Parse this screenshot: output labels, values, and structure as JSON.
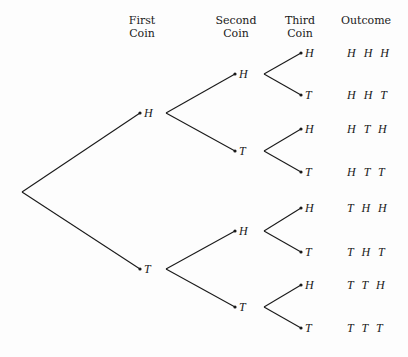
{
  "headers": {
    "first": [
      "First",
      "Coin"
    ],
    "second": [
      "Second",
      "Coin"
    ],
    "third": [
      "Third",
      "Coin"
    ],
    "outcome": "Outcome"
  },
  "tree": {
    "root": {
      "x": 22,
      "y": 192
    },
    "first": [
      {
        "label": "H",
        "x": 140,
        "y": 113,
        "fork_x": 166
      },
      {
        "label": "T",
        "x": 140,
        "y": 269,
        "fork_x": 166
      }
    ],
    "second": [
      {
        "label": "H",
        "parent": 0,
        "x": 235,
        "y": 74,
        "fork_x": 264
      },
      {
        "label": "T",
        "parent": 0,
        "x": 235,
        "y": 151,
        "fork_x": 264
      },
      {
        "label": "H",
        "parent": 1,
        "x": 235,
        "y": 231,
        "fork_x": 264
      },
      {
        "label": "T",
        "parent": 1,
        "x": 235,
        "y": 307,
        "fork_x": 264
      }
    ],
    "third": [
      {
        "label": "H",
        "parent": 0,
        "x": 301,
        "y": 53
      },
      {
        "label": "T",
        "parent": 0,
        "x": 301,
        "y": 95
      },
      {
        "label": "H",
        "parent": 1,
        "x": 301,
        "y": 129
      },
      {
        "label": "T",
        "parent": 1,
        "x": 301,
        "y": 172
      },
      {
        "label": "H",
        "parent": 2,
        "x": 301,
        "y": 208
      },
      {
        "label": "T",
        "parent": 2,
        "x": 301,
        "y": 252
      },
      {
        "label": "H",
        "parent": 3,
        "x": 301,
        "y": 285
      },
      {
        "label": "T",
        "parent": 3,
        "x": 301,
        "y": 328
      }
    ]
  },
  "outcomes": [
    "H H H",
    "H H T",
    "H T H",
    "H T T",
    "T H H",
    "T H T",
    "T T H",
    "T T T"
  ],
  "colors": {
    "line": "#1a1a1a",
    "background": "#fdfdfd"
  }
}
